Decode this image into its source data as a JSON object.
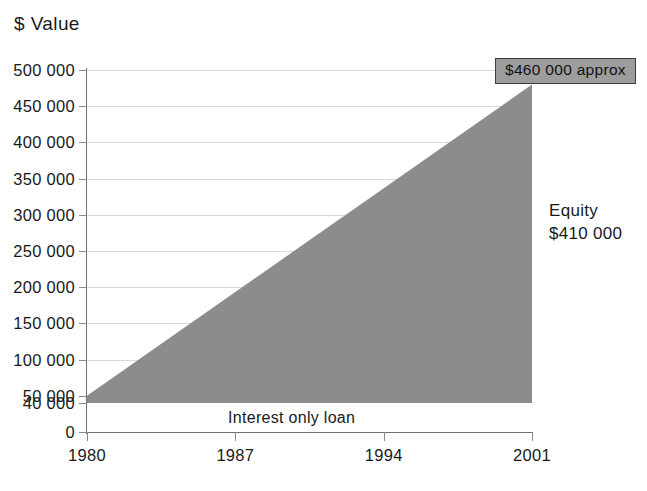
{
  "chart_data": {
    "type": "area",
    "title": "",
    "xlabel": "Years",
    "ylabel": "$ Value",
    "xlim": [
      1980,
      2001
    ],
    "ylim": [
      0,
      500000
    ],
    "grid": true,
    "legend": "none",
    "x_ticks": [
      "1980",
      "1987",
      "1994",
      "2001"
    ],
    "x_tick_values": [
      1980,
      1987,
      1994,
      2001
    ],
    "y_ticks": [
      "500 000",
      "450 000",
      "400 000",
      "350 000",
      "300 000",
      "250 000",
      "200 000",
      "150 000",
      "100 000",
      "50 000",
      "40 000",
      "0"
    ],
    "y_tick_values": [
      500000,
      450000,
      400000,
      350000,
      300000,
      250000,
      200000,
      150000,
      100000,
      50000,
      40000,
      0
    ],
    "gridline_values": [
      500000,
      450000,
      400000,
      350000,
      300000,
      250000,
      200000,
      150000,
      100000,
      50000
    ],
    "series": [
      {
        "name": "Equity",
        "fill_color": "#8c8c8c",
        "baseline": 40000,
        "x": [
          1980,
          2001
        ],
        "values": [
          50000,
          480000
        ]
      }
    ],
    "annotations": [
      {
        "name": "property-value-callout",
        "text": "$460 000 approx",
        "x": 2001,
        "y": 480000
      },
      {
        "name": "equity-label",
        "text_line1": "Equity",
        "text_line2": "$410 000",
        "x": 2001,
        "y": 250000
      },
      {
        "name": "loan-label",
        "text": "Interest only loan",
        "x": 1987.5,
        "y": 20000
      }
    ],
    "colors": {
      "area_fill": "#8c8c8c",
      "axis": "#6e6e6e",
      "gridline": "#d9d9d9",
      "text": "#1a1a1a",
      "callout_fill": "#9d9d9d",
      "callout_border": "#3d3d3d"
    }
  },
  "axes": {
    "y_title": "$ Value",
    "x_title": "Years"
  },
  "annotations": {
    "callout": "$460 000 approx",
    "equity_title": "Equity",
    "equity_value": "$410 000",
    "loan": "Interest only loan"
  }
}
